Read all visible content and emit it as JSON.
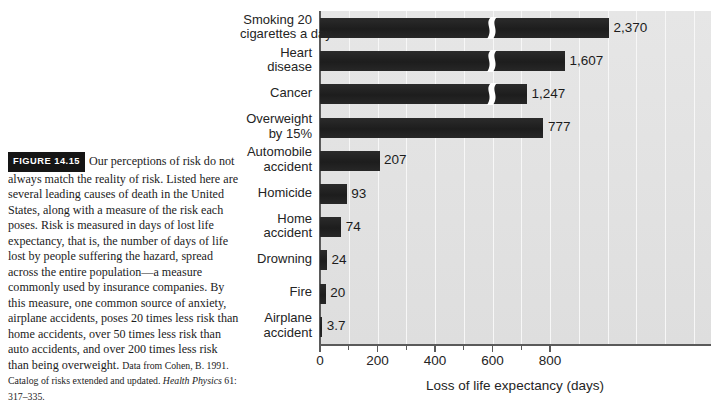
{
  "figure": {
    "tag": "FIGURE 14.15",
    "caption": "Our perceptions of risk do not always match the reality of risk. Listed here are several leading causes of death in the United States, along with a measure of the risk each poses. Risk is measured in days of lost life expectancy, that is, the number of days of life lost by people suffering the hazard, spread across the entire population—a measure commonly used by insurance companies. By this measure, one common source of anxiety, airplane accidents, poses 20 times less risk than home accidents, over 50 times less risk than auto accidents, and over 200 times less risk than being overweight.",
    "source_prefix": "Data from Cohen, B. 1991. Catalog of risks extended and updated. ",
    "source_journal": "Health Physics",
    "source_suffix": " 61: 317–335."
  },
  "chart_data": {
    "type": "bar",
    "orientation": "horizontal",
    "title": "",
    "xlabel": "Loss of life expectancy (days)",
    "ylabel": "",
    "xlim": [
      0,
      900
    ],
    "xticks": [
      0,
      200,
      400,
      600,
      800
    ],
    "xticklabels": [
      "0",
      "200",
      "400",
      "600",
      "800"
    ],
    "minor_xticks": [
      100,
      300,
      500,
      700
    ],
    "grid": "vertical-white-gridlines-every-100",
    "axis_break": "Bars exceeding the axis maximum are drawn with an S-shaped break symbol and labelled with their true value.",
    "categories": [
      "Smoking 20 cigarettes a day",
      "Heart disease",
      "Cancer",
      "Overweight by 15%",
      "Automobile accident",
      "Homicide",
      "Home accident",
      "Drowning",
      "Fire",
      "Airplane accident"
    ],
    "category_lines": [
      [
        "Smoking 20",
        "cigarettes a day"
      ],
      [
        "Heart",
        "disease"
      ],
      [
        "Cancer"
      ],
      [
        "Overweight",
        "by 15%"
      ],
      [
        "Automobile",
        "accident"
      ],
      [
        "Homicide"
      ],
      [
        "Home",
        "accident"
      ],
      [
        "Drowning"
      ],
      [
        "Fire"
      ],
      [
        "Airplane",
        "accident"
      ]
    ],
    "values": [
      2370,
      1607,
      1247,
      777,
      207,
      93,
      74,
      24,
      20,
      3.7
    ],
    "value_labels": [
      "2,370",
      "1,607",
      "1,247",
      "777",
      "207",
      "93",
      "74",
      "24",
      "20",
      "3.7"
    ],
    "broken": [
      true,
      true,
      true,
      false,
      false,
      false,
      false,
      false,
      false,
      false
    ],
    "drawn_px_end": [
      908,
      768,
      648,
      777,
      207,
      93,
      74,
      24,
      20,
      3.7
    ],
    "colors": {
      "bar": "#232323",
      "panel": "#e2e2e2",
      "gridline": "#f7f7f7",
      "axis": "#5a5a5a",
      "text": "#242424",
      "page": "#ffffff"
    }
  }
}
